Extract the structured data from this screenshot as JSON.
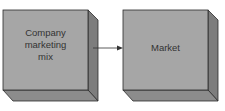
{
  "diagram": {
    "boxes": [
      {
        "label_lines": [
          "Company",
          "marketing",
          "mix"
        ]
      },
      {
        "label_lines": [
          "Market"
        ]
      }
    ],
    "arrow": {
      "from": "Company marketing mix",
      "to": "Market"
    },
    "colors": {
      "front": "#a6a6a6",
      "side": "#7d7d7d",
      "bottom": "#8c8c8c",
      "edge": "#2b2b2b"
    }
  }
}
